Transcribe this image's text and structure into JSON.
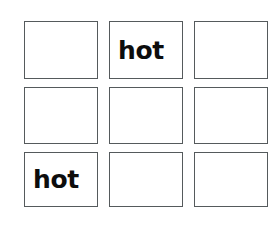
{
  "page": {
    "background_color": "#ffffff",
    "border_color": "#555a5c",
    "text_color": "#0d0d0d"
  },
  "grid": {
    "rows": 3,
    "columns": 3,
    "cells": [
      {
        "row": 1,
        "column": 1,
        "label": ""
      },
      {
        "row": 1,
        "column": 2,
        "label": "hot"
      },
      {
        "row": 1,
        "column": 3,
        "label": ""
      },
      {
        "row": 2,
        "column": 1,
        "label": ""
      },
      {
        "row": 2,
        "column": 2,
        "label": ""
      },
      {
        "row": 2,
        "column": 3,
        "label": ""
      },
      {
        "row": 3,
        "column": 1,
        "label": "hot"
      },
      {
        "row": 3,
        "column": 2,
        "label": ""
      },
      {
        "row": 3,
        "column": 3,
        "label": ""
      }
    ]
  }
}
